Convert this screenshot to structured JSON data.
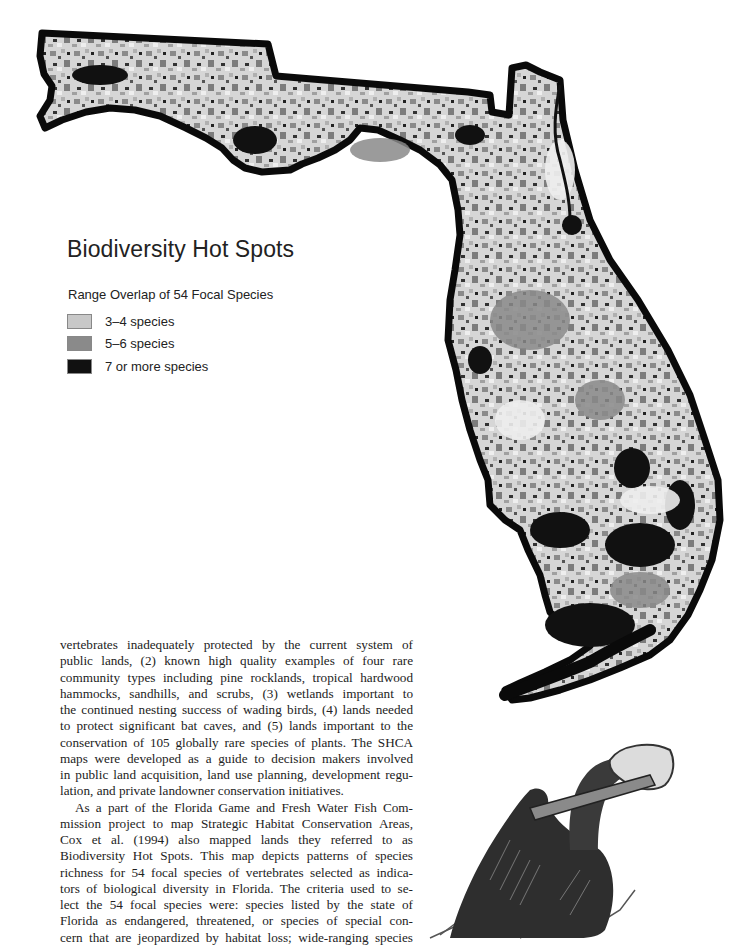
{
  "map": {
    "title": "Biodiversity Hot Spots",
    "subtitle": "Range Overlap of 54 Focal Species",
    "legend": [
      {
        "label": "3–4 species",
        "color": "#c8c8c8"
      },
      {
        "label": "5–6 species",
        "color": "#8a8a8a"
      },
      {
        "label": "7 or more species",
        "color": "#111111"
      }
    ],
    "outline_color": "#0a0a0a",
    "land_color": "#d4d4d4"
  },
  "body": {
    "paragraph1_lines": [
      "vertebrates inadequately protected by the current system of",
      "public lands, (2) known high quality examples of four rare",
      "community types including pine rocklands, tropical hardwood",
      "hammocks, sandhills, and scrubs, (3) wetlands important to",
      "the continued nesting success of wading birds, (4) lands needed",
      "to protect significant bat caves, and (5) lands important to the",
      "conservation of 105 globally rare species of plants. The SHCA",
      "maps were developed as a guide to decision makers involved",
      "in public land acquisition, land use planning, development regu-",
      "lation, and private landowner conservation initiatives."
    ],
    "paragraph2_lines": [
      "As a part of the Florida Game and Fresh Water Fish Com-",
      "mission project to map Strategic Habitat Conservation Areas,",
      "Cox et al. (1994) also mapped lands they referred to as",
      "Biodiversity Hot Spots. This map depicts patterns of species",
      "richness for 54 focal species of vertebrates selected as indica-",
      "tors of biological diversity in Florida. The criteria used to se-",
      "lect the 54 focal species were: species listed by the state of",
      "Florida as endangered, threatened, or species of special con-",
      "cern that are jeopardized by habitat loss; wide-ranging species"
    ]
  },
  "illustration": {
    "subject": "brown-pelican-drawing"
  }
}
